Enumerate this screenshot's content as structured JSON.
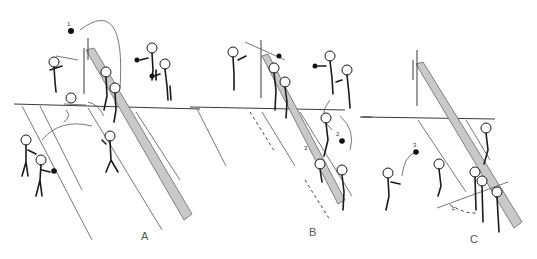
{
  "figure": {
    "panels": [
      {
        "id": "A",
        "label": "A",
        "numerals": [
          "1"
        ]
      },
      {
        "id": "B",
        "label": "B",
        "numerals": [
          "2",
          "3"
        ]
      },
      {
        "id": "C",
        "label": "C",
        "numerals": [
          "3"
        ],
        "annotation": "F"
      }
    ],
    "colors": {
      "line": "#3a3a3a",
      "net_band": "#c9c9c9",
      "background": "#ffffff"
    }
  }
}
